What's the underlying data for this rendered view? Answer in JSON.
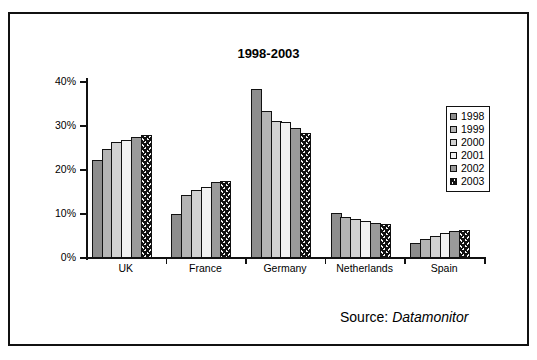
{
  "chart_data": {
    "type": "bar",
    "title": "1998-2003",
    "xlabel": "",
    "ylabel": "",
    "ylim": [
      0,
      40
    ],
    "ytick_labels": [
      "0%",
      "10%",
      "20%",
      "30%",
      "40%"
    ],
    "ytick_values": [
      0,
      10,
      20,
      30,
      40
    ],
    "grid": false,
    "legend_position": "right",
    "categories": [
      "UK",
      "France",
      "Germany",
      "Netherlands",
      "Spain"
    ],
    "series": [
      {
        "name": "1998",
        "values": [
          22.2,
          10.0,
          38.5,
          10.2,
          3.5
        ]
      },
      {
        "name": "1999",
        "values": [
          24.8,
          14.3,
          33.4,
          9.4,
          4.4
        ]
      },
      {
        "name": "2000",
        "values": [
          26.4,
          15.5,
          31.2,
          8.9,
          5.0
        ]
      },
      {
        "name": "2001",
        "values": [
          26.9,
          16.1,
          30.8,
          8.3,
          5.7
        ]
      },
      {
        "name": "2002",
        "values": [
          27.5,
          17.2,
          29.5,
          7.9,
          6.1
        ]
      },
      {
        "name": "2003",
        "values": [
          28.0,
          17.5,
          28.5,
          7.7,
          6.3
        ]
      }
    ],
    "series_colors": [
      "#8d8d8d",
      "#b4b4b4",
      "#d2d2d2",
      "#f2f2f2",
      "#9a9a9a",
      "#f4f4f4"
    ],
    "annotations": {
      "source_prefix": "Source:",
      "source_name": "Datamonitor"
    }
  }
}
